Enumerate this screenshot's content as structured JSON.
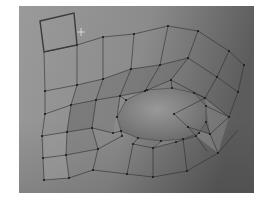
{
  "viewport": {
    "kind": "3d-modeling-viewport",
    "background_top": "#8f8f8f",
    "background_bottom": "#7a7a7a",
    "selection_color": "#a9a9a9"
  },
  "mesh": {
    "description": "quad mesh with oval hole, one face selected",
    "selected_face": [
      [
        40,
        21
      ],
      [
        74,
        13
      ],
      [
        77,
        45
      ],
      [
        44,
        52
      ]
    ],
    "vertices": [
      [
        77,
        45
      ],
      [
        103,
        37
      ],
      [
        134,
        34
      ],
      [
        168,
        26
      ],
      [
        198,
        31
      ],
      [
        229,
        51
      ],
      [
        244,
        65
      ],
      [
        45,
        91
      ],
      [
        77,
        85
      ],
      [
        103,
        79
      ],
      [
        131,
        69
      ],
      [
        160,
        65
      ],
      [
        188,
        58
      ],
      [
        217,
        77
      ],
      [
        238,
        92
      ],
      [
        45,
        114
      ],
      [
        71,
        105
      ],
      [
        96,
        100
      ],
      [
        120,
        96
      ],
      [
        145,
        91
      ],
      [
        171,
        80
      ],
      [
        205,
        98
      ],
      [
        229,
        117
      ],
      [
        42,
        136
      ],
      [
        67,
        132
      ],
      [
        92,
        128
      ],
      [
        113,
        133
      ],
      [
        124,
        125
      ],
      [
        143,
        121
      ],
      [
        174,
        114
      ],
      [
        188,
        127
      ],
      [
        210,
        134
      ],
      [
        43,
        158
      ],
      [
        66,
        155
      ],
      [
        98,
        149
      ],
      [
        122,
        136
      ],
      [
        133,
        144
      ],
      [
        153,
        148
      ],
      [
        176,
        142
      ],
      [
        196,
        136
      ],
      [
        207,
        151
      ],
      [
        44,
        180
      ],
      [
        69,
        178
      ],
      [
        93,
        170
      ],
      [
        127,
        174
      ],
      [
        153,
        177
      ],
      [
        187,
        171
      ],
      [
        218,
        153
      ]
    ],
    "hole_vertices": [
      [
        126,
        100
      ],
      [
        147,
        90
      ],
      [
        172,
        88
      ],
      [
        194,
        93
      ],
      [
        206,
        106
      ],
      [
        206,
        122
      ],
      [
        199,
        133
      ],
      [
        183,
        139
      ],
      [
        161,
        141
      ],
      [
        138,
        138
      ],
      [
        121,
        131
      ],
      [
        117,
        117
      ]
    ]
  },
  "cursor": {
    "type": "crosshair",
    "x": 81,
    "y": 32
  }
}
